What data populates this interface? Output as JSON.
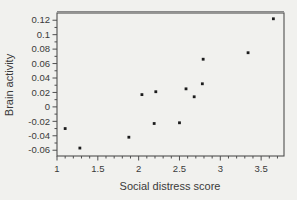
{
  "figure": {
    "background": "#f1f1ee",
    "frame_color": "#4f4f4f",
    "top_edge_color": "#8a8a8a",
    "text_color": "#3a3a3a",
    "point_color": "#1c1c1c"
  },
  "chart_data": {
    "type": "scatter",
    "title": "",
    "xlabel": "Social distress score",
    "ylabel": "Brain activity",
    "xlim": [
      1.0,
      3.78
    ],
    "ylim": [
      -0.068,
      0.13
    ],
    "grid": false,
    "legend": false,
    "x_major_ticks": [
      1,
      1.5,
      2,
      2.5,
      3,
      3.5
    ],
    "x_tick_labels": [
      "1",
      "1.5",
      "2",
      "2.5",
      "3",
      "3.5"
    ],
    "x_minor_step": 0.1,
    "y_major_ticks": [
      0.12,
      0.1,
      0.08,
      0.06,
      0.04,
      0.02,
      0,
      -0.02,
      -0.04,
      -0.06
    ],
    "y_tick_labels": [
      "0.12",
      "0.1",
      "0.08",
      "0.06",
      "0.04",
      "0.02",
      "0",
      "-0.02",
      "-0.04",
      "-0.06"
    ],
    "y_minor_step": 0.01,
    "points": [
      {
        "x": 1.1,
        "y": -0.03
      },
      {
        "x": 1.28,
        "y": -0.057
      },
      {
        "x": 1.88,
        "y": -0.042
      },
      {
        "x": 2.04,
        "y": 0.017
      },
      {
        "x": 2.19,
        "y": -0.023
      },
      {
        "x": 2.21,
        "y": 0.021
      },
      {
        "x": 2.5,
        "y": -0.022
      },
      {
        "x": 2.58,
        "y": 0.025
      },
      {
        "x": 2.68,
        "y": 0.014
      },
      {
        "x": 2.78,
        "y": 0.032
      },
      {
        "x": 2.79,
        "y": 0.066
      },
      {
        "x": 3.34,
        "y": 0.075
      },
      {
        "x": 3.65,
        "y": 0.122
      }
    ]
  }
}
